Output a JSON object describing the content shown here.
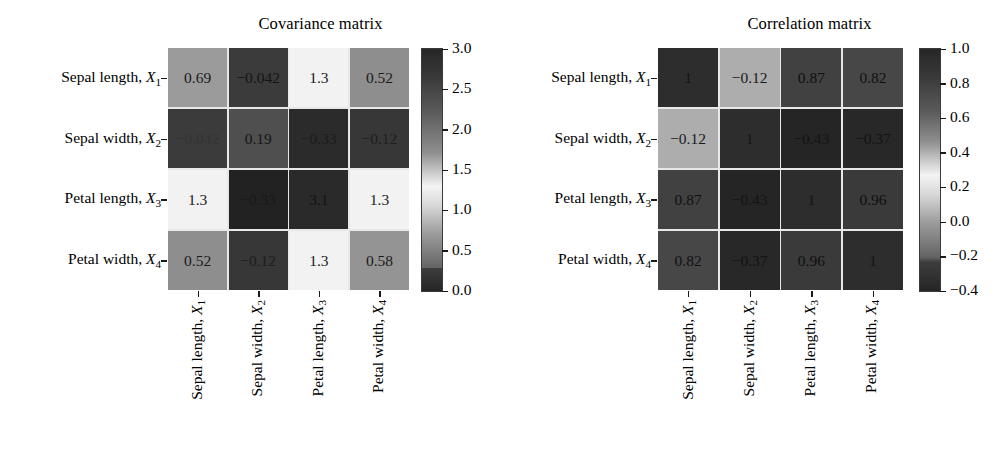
{
  "figure": {
    "width": 1002,
    "height": 470,
    "background": "#ffffff",
    "text_color": "#000000"
  },
  "panels": [
    {
      "id": "cov",
      "title": "Covariance matrix"
    },
    {
      "id": "cor",
      "title": "Correlation matrix"
    }
  ],
  "variables": [
    {
      "name": "Sepal length",
      "symbol": "X",
      "index": "1"
    },
    {
      "name": "Sepal width",
      "symbol": "X",
      "index": "2"
    },
    {
      "name": "Petal length",
      "symbol": "X",
      "index": "3"
    },
    {
      "name": "Petal width",
      "symbol": "X",
      "index": "4"
    }
  ],
  "labels": {
    "y": [
      "Sepal length, X1",
      "Sepal width, X2",
      "Petal length, X3",
      "Petal width, X4"
    ],
    "x": [
      "Sepal length, X1",
      "Sepal width, X2",
      "Petal length, X3",
      "Petal width, X4"
    ]
  },
  "chart_data": [
    {
      "type": "heatmap",
      "title": "Covariance matrix",
      "xlabel": "",
      "ylabel": "",
      "xticklabels": [
        "Sepal length, X₁",
        "Sepal width, X₂",
        "Petal length, X₃",
        "Petal width, X₄"
      ],
      "yticklabels": [
        "Sepal length, X₁",
        "Sepal width, X₂",
        "Petal length, X₃",
        "Petal width, X₄"
      ],
      "grid": false,
      "legend": "none",
      "colorbar": {
        "position": "right",
        "vmin": -0.33,
        "vmax": 3.1,
        "ticks": [
          "3.0",
          "2.5",
          "2.0",
          "1.5",
          "1.0",
          "0.5",
          "0.0"
        ],
        "tick_values": [
          3.0,
          2.5,
          2.0,
          1.5,
          1.0,
          0.5,
          0.0
        ],
        "colormap": "grayscale-cyclic (dark-light-dark)"
      },
      "matrix": [
        [
          0.69,
          -0.042,
          1.3,
          0.52
        ],
        [
          -0.042,
          0.19,
          -0.33,
          -0.12
        ],
        [
          1.3,
          -0.33,
          3.1,
          1.3
        ],
        [
          0.52,
          -0.12,
          1.3,
          0.58
        ]
      ],
      "cell_labels": [
        [
          "0.69",
          "−0.042",
          "1.3",
          "0.52"
        ],
        [
          "−0.042",
          "0.19",
          "−0.33",
          "−0.12"
        ],
        [
          "1.3",
          "−0.33",
          "3.1",
          "1.3"
        ],
        [
          "0.52",
          "−0.12",
          "1.3",
          "0.58"
        ]
      ],
      "cell_fills": [
        [
          "#9b9b9b",
          "#3b3b3b",
          "#f2f2f2",
          "#8e8e8e"
        ],
        [
          "#3b3b3b",
          "#4f4f4f",
          "#2b2b2b",
          "#373737"
        ],
        [
          "#f2f2f2",
          "#222222",
          "#2a2a2a",
          "#f2f2f2"
        ],
        [
          "#8e8e8e",
          "#373737",
          "#f2f2f2",
          "#949494"
        ]
      ],
      "cell_text_colors": [
        [
          "#1a1a1a",
          "#141414",
          "#1a1a1a",
          "#1a1a1a"
        ],
        [
          "#343434",
          "#151515",
          "#1c1c1c",
          "#1e1e1e"
        ],
        [
          "#1a1a1a",
          "#181818",
          "#121212",
          "#1a1a1a"
        ],
        [
          "#1a1a1a",
          "#1d1d1d",
          "#1a1a1a",
          "#1a1a1a"
        ]
      ]
    },
    {
      "type": "heatmap",
      "title": "Correlation matrix",
      "xlabel": "",
      "ylabel": "",
      "xticklabels": [
        "Sepal length, X₁",
        "Sepal width, X₂",
        "Petal length, X₃",
        "Petal width, X₄"
      ],
      "yticklabels": [
        "Sepal length, X₁",
        "Sepal width, X₂",
        "Petal length, X₃",
        "Petal width, X₄"
      ],
      "grid": false,
      "legend": "none",
      "colorbar": {
        "position": "right",
        "vmin": -0.43,
        "vmax": 1.0,
        "ticks": [
          "1.0",
          "0.8",
          "0.6",
          "0.4",
          "0.2",
          "0.0",
          "−0.2",
          "−0.4"
        ],
        "tick_values": [
          1.0,
          0.8,
          0.6,
          0.4,
          0.2,
          0.0,
          -0.2,
          -0.4
        ],
        "colormap": "grayscale-cyclic (dark-light-dark)"
      },
      "matrix": [
        [
          1.0,
          -0.12,
          0.87,
          0.82
        ],
        [
          -0.12,
          1.0,
          -0.43,
          -0.37
        ],
        [
          0.87,
          -0.43,
          1.0,
          0.96
        ],
        [
          0.82,
          -0.37,
          0.96,
          1.0
        ]
      ],
      "cell_labels": [
        [
          "1",
          "−0.12",
          "0.87",
          "0.82"
        ],
        [
          "−0.12",
          "1",
          "−0.43",
          "−0.37"
        ],
        [
          "0.87",
          "−0.43",
          "1",
          "0.96"
        ],
        [
          "0.82",
          "−0.37",
          "0.96",
          "1"
        ]
      ],
      "cell_fills": [
        [
          "#2d2d2d",
          "#adadad",
          "#414141",
          "#474747"
        ],
        [
          "#adadad",
          "#2d2d2d",
          "#252525",
          "#282828"
        ],
        [
          "#414141",
          "#252525",
          "#2d2d2d",
          "#3a3a3a"
        ],
        [
          "#474747",
          "#282828",
          "#3a3a3a",
          "#2d2d2d"
        ]
      ],
      "cell_text_colors": [
        [
          "#141414",
          "#1a1a1a",
          "#101010",
          "#111111"
        ],
        [
          "#1a1a1a",
          "#141414",
          "#141414",
          "#131313"
        ],
        [
          "#101010",
          "#141414",
          "#141414",
          "#0f0f0f"
        ],
        [
          "#111111",
          "#131313",
          "#0f0f0f",
          "#141414"
        ]
      ]
    }
  ]
}
